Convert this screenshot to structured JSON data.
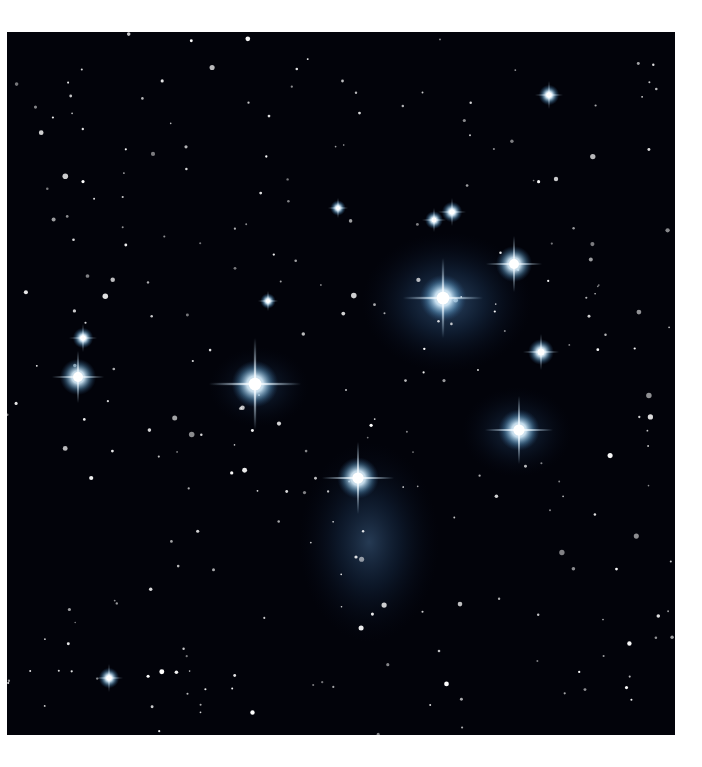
{
  "image": {
    "subject": "Pleiades star cluster (M45) with blue reflection nebulosity",
    "background_color": "#02030a",
    "nebula_color": "#3a6a9a",
    "star_color": "#ffffff",
    "bright_stars": [
      {
        "x": 248,
        "y": 352,
        "r": 9,
        "spike": 46
      },
      {
        "x": 436,
        "y": 266,
        "r": 9,
        "spike": 40
      },
      {
        "x": 351,
        "y": 446,
        "r": 8,
        "spike": 36
      },
      {
        "x": 512,
        "y": 398,
        "r": 8,
        "spike": 34
      },
      {
        "x": 507,
        "y": 232,
        "r": 7,
        "spike": 28
      },
      {
        "x": 71,
        "y": 345,
        "r": 7,
        "spike": 26
      },
      {
        "x": 534,
        "y": 320,
        "r": 5,
        "spike": 18
      },
      {
        "x": 76,
        "y": 306,
        "r": 4,
        "spike": 14
      },
      {
        "x": 445,
        "y": 180,
        "r": 4,
        "spike": 14
      },
      {
        "x": 427,
        "y": 188,
        "r": 3.5,
        "spike": 12
      },
      {
        "x": 542,
        "y": 63,
        "r": 4,
        "spike": 14
      },
      {
        "x": 102,
        "y": 646,
        "r": 4,
        "spike": 14
      },
      {
        "x": 331,
        "y": 176,
        "r": 3,
        "spike": 10
      },
      {
        "x": 261,
        "y": 269,
        "r": 3,
        "spike": 10
      }
    ],
    "nebulae": [
      {
        "cx": 440,
        "cy": 270,
        "rx": 85,
        "ry": 70,
        "opacity": 0.55
      },
      {
        "cx": 362,
        "cy": 510,
        "rx": 70,
        "ry": 100,
        "opacity": 0.45
      },
      {
        "cx": 510,
        "cy": 400,
        "rx": 55,
        "ry": 45,
        "opacity": 0.35
      },
      {
        "cx": 252,
        "cy": 355,
        "rx": 50,
        "ry": 40,
        "opacity": 0.3
      }
    ]
  }
}
